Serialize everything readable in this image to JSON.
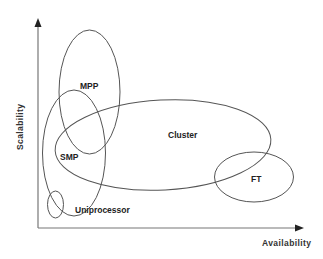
{
  "diagram": {
    "type": "overlapping-regions",
    "axes": {
      "x_label": "Availability",
      "y_label": "Scalability"
    },
    "regions": [
      {
        "name": "MPP",
        "label": "MPP"
      },
      {
        "name": "SMP",
        "label": "SMP"
      },
      {
        "name": "Cluster",
        "label": "Cluster"
      },
      {
        "name": "FT",
        "label": "FT"
      },
      {
        "name": "Uniprocessor",
        "label": "Uniprocessor"
      }
    ],
    "colors": {
      "stroke": "#555555",
      "text": "#222222",
      "background": "#ffffff"
    }
  }
}
